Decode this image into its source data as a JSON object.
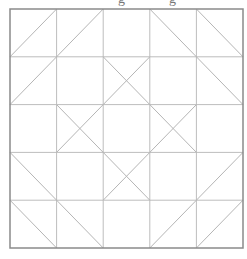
{
  "diagram": {
    "type": "quilt-block-grid",
    "rows": 5,
    "cols": 5,
    "bounds": {
      "x0": 10,
      "y0": 9,
      "x1": 243,
      "y1": 248
    },
    "colors": {
      "background": "#ffffff",
      "border": "#8a8a8a",
      "grid": "#bdbdbd",
      "diagonal": "#b5b5b5"
    },
    "cells": [
      [
        "/",
        "/",
        "",
        "\\",
        "\\"
      ],
      [
        "/",
        "",
        "X",
        "",
        "\\"
      ],
      [
        "",
        "X",
        "",
        "X",
        ""
      ],
      [
        "\\",
        "",
        "X",
        "",
        "/"
      ],
      [
        "\\",
        "\\",
        "",
        "/",
        "/"
      ]
    ],
    "legend": {
      "/": "diagonal from bottom-left to top-right",
      "\\": "diagonal from top-left to bottom-right",
      "X": "both diagonals",
      "": "plain square"
    }
  }
}
